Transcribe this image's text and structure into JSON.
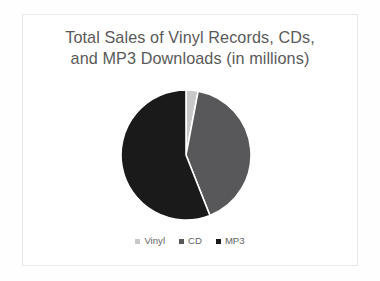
{
  "slide": {
    "background_color": "#ffffff",
    "frame_color": "#e9e9e9"
  },
  "chart_title": "Total Sales of Vinyl Records, CDs,\nand MP3 Downloads (in millions)",
  "title_color": "#5a5a5a",
  "legend": {
    "position": "bottom",
    "items": [
      {
        "label": "Vinyl",
        "color": "#c8c8c8"
      },
      {
        "label": "CD",
        "color": "#58585a"
      },
      {
        "label": "MP3",
        "color": "#1a1a1a"
      }
    ]
  },
  "chart_data": {
    "type": "pie",
    "title": "Total Sales of Vinyl Records, CDs, and MP3 Downloads (in millions)",
    "xlabel": "",
    "ylabel": "",
    "categories": [
      "Vinyl",
      "CD",
      "MP3"
    ],
    "values": [
      3,
      41,
      56
    ],
    "unit": "millions",
    "colors": [
      "#c8c8c8",
      "#58585a",
      "#1a1a1a"
    ],
    "slice_angles_deg": [
      12,
      148,
      200
    ],
    "start_angle_deg": 0,
    "direction": "clockwise",
    "grid": false,
    "legend_position": "bottom",
    "data_labels_shown": false,
    "center_px": [
      186,
      153
    ],
    "radius_px": 66
  }
}
